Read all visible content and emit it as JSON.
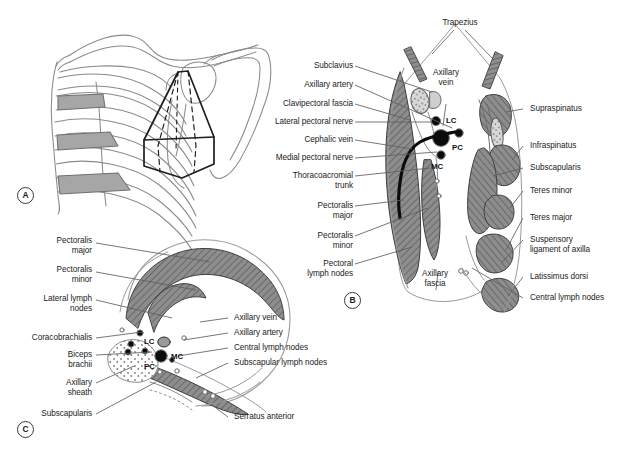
{
  "figure": {
    "type": "anatomy-diagram",
    "panels": [
      {
        "id": "A",
        "marker": "A",
        "caption": "Pyramidal outline of the axilla on the thoracic cage and shoulder girdle"
      },
      {
        "id": "B",
        "marker": "B",
        "caption": "Sagittal section through the axilla"
      },
      {
        "id": "C",
        "marker": "C",
        "caption": "Horizontal (axial) section through the axilla"
      }
    ]
  },
  "panelA": {
    "marker": "A"
  },
  "panelB": {
    "marker": "B",
    "top_label": "Trapezius",
    "inner_labels": [
      {
        "text": "Axillary\nvein",
        "name": "axillary-vein"
      },
      {
        "text": "LC",
        "name": "lateral-cord"
      },
      {
        "text": "PC",
        "name": "posterior-cord"
      },
      {
        "text": "MC",
        "name": "medial-cord"
      },
      {
        "text": "Axillary\nfascia",
        "name": "axillary-fascia"
      }
    ],
    "left_labels": [
      "Subclavius",
      "Axillary artery",
      "Clavipectoral fascia",
      "Lateral pectoral nerve",
      "Cephalic vein",
      "Medial pectoral nerve",
      "Thoracoacromial\ntrunk",
      "Pectoralis\nmajor",
      "Pectoralis\nminor",
      "Pectoral\nlymph nodes"
    ],
    "right_labels": [
      "Supraspinatus",
      "Infraspinatus",
      "Subscapularis",
      "Teres minor",
      "Teres major",
      "Suspensory\nligament of axilla",
      "Latissimus dorsi",
      "Central lymph nodes"
    ]
  },
  "panelC": {
    "marker": "C",
    "inner_labels": [
      {
        "text": "LC",
        "name": "lateral-cord"
      },
      {
        "text": "PC",
        "name": "posterior-cord"
      },
      {
        "text": "MC",
        "name": "medial-cord"
      }
    ],
    "left_labels": [
      "Pectoralis\nmajor",
      "Pectoralis\nminor",
      "Lateral lymph\nnodes",
      "Coracobrachialis",
      "Biceps\nbrachii",
      "Axillary\nsheath",
      "Subscapularis"
    ],
    "right_labels": [
      "Axillary vein",
      "Axillary artery",
      "Central lymph nodes",
      "Subscapular lymph nodes",
      "Serratus anterior"
    ]
  },
  "colors": {
    "background": "#ffffff",
    "line": "#6e6e6e",
    "dark_line": "#2a2a2a",
    "muscle_fill": "#8d8d8d",
    "bone_fill": "#c9c9c9",
    "text": "#1b1b1b",
    "node_fill": "#000000"
  }
}
